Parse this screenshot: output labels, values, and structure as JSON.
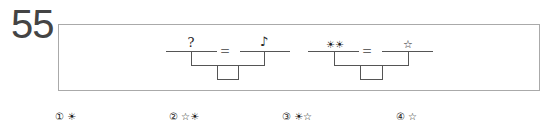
{
  "question": {
    "number": "55",
    "diagrams": [
      {
        "left_symbol": "?",
        "equals": "=",
        "right_symbol": "♪",
        "blank_box": ""
      },
      {
        "left_symbol": "☀☀",
        "equals": "=",
        "right_symbol": "☆",
        "blank_box": ""
      }
    ],
    "options": [
      {
        "marker": "①",
        "value": "☀"
      },
      {
        "marker": "②",
        "value": "☆☀"
      },
      {
        "marker": "③",
        "value": "☀☆"
      },
      {
        "marker": "④",
        "value": "☆"
      }
    ]
  }
}
